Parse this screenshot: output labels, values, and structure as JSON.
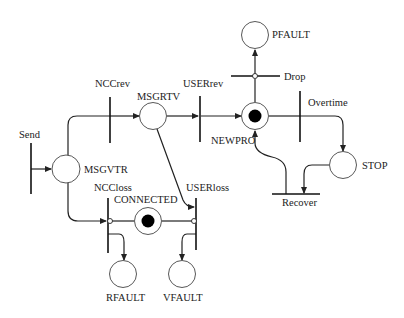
{
  "diagram": {
    "type": "petri-net",
    "places": [
      {
        "id": "MSGVTR",
        "label": "MSGVTR",
        "tokens": 0
      },
      {
        "id": "MSGRTV",
        "label": "MSGRTV",
        "tokens": 0
      },
      {
        "id": "NEWPRO",
        "label": "NEWPRO",
        "tokens": 1
      },
      {
        "id": "PFAULT",
        "label": "PFAULT",
        "tokens": 0
      },
      {
        "id": "STOP",
        "label": "STOP",
        "tokens": 0
      },
      {
        "id": "CONNECTED",
        "label": "CONNECTED",
        "tokens": 1
      },
      {
        "id": "RFAULT",
        "label": "RFAULT",
        "tokens": 0
      },
      {
        "id": "VFAULT",
        "label": "VFAULT",
        "tokens": 0
      }
    ],
    "transitions": [
      {
        "id": "Send",
        "label": "Send"
      },
      {
        "id": "NCCrev",
        "label": "NCCrev"
      },
      {
        "id": "USERrev",
        "label": "USERrev"
      },
      {
        "id": "Drop",
        "label": "Drop"
      },
      {
        "id": "Overtime",
        "label": "Overtime"
      },
      {
        "id": "Recover",
        "label": "Recover"
      },
      {
        "id": "NCCloss",
        "label": "NCCloss"
      },
      {
        "id": "USERloss",
        "label": "USERloss"
      }
    ],
    "arcs": [
      {
        "from": "Send",
        "to": "MSGVTR"
      },
      {
        "from": "MSGVTR",
        "to": "NCCrev"
      },
      {
        "from": "NCCrev",
        "to": "MSGRTV"
      },
      {
        "from": "MSGRTV",
        "to": "USERrev"
      },
      {
        "from": "USERrev",
        "to": "NEWPRO"
      },
      {
        "from": "NEWPRO",
        "to": "Drop",
        "kind": "inhibitor"
      },
      {
        "from": "Drop",
        "to": "PFAULT"
      },
      {
        "from": "NEWPRO",
        "to": "Overtime"
      },
      {
        "from": "Overtime",
        "to": "STOP"
      },
      {
        "from": "STOP",
        "to": "Recover"
      },
      {
        "from": "Recover",
        "to": "NEWPRO"
      },
      {
        "from": "MSGVTR",
        "to": "NCCloss"
      },
      {
        "from": "MSGRTV",
        "to": "USERloss"
      },
      {
        "from": "CONNECTED",
        "to": "NCCloss",
        "kind": "inhibitor"
      },
      {
        "from": "CONNECTED",
        "to": "USERloss",
        "kind": "inhibitor"
      },
      {
        "from": "NCCloss",
        "to": "RFAULT"
      },
      {
        "from": "USERloss",
        "to": "VFAULT"
      }
    ]
  }
}
